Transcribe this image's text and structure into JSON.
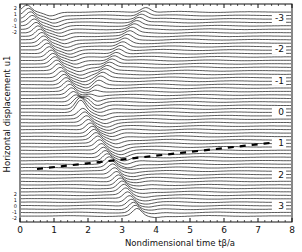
{
  "chart_data": {
    "type": "line",
    "subtype": "waterfall / stacked time traces",
    "title": "",
    "xlabel": "Nondimensional time tβ/a",
    "ylabel": "Horizontal displacement u1",
    "xlim": [
      0,
      8
    ],
    "x_ticks": [
      "0",
      "1",
      "2",
      "3",
      "4",
      "5",
      "6",
      "7",
      "8"
    ],
    "trace_scale_ticks_top": [
      "2",
      "1",
      "0",
      "-1",
      "-2"
    ],
    "trace_scale_ticks_bottom": [
      "2",
      "1",
      "0",
      "-1",
      "-2"
    ],
    "right_trace_labels": [
      "-3",
      "-2",
      "-1",
      "0",
      "1",
      "2",
      "3"
    ],
    "grid": false,
    "legend": null,
    "n_traces": 60,
    "features": [
      {
        "name": "dark diagonal wavefront",
        "from_x": 0.2,
        "to_x": 3.5,
        "direction": "down-right"
      },
      {
        "name": "second diagonal wavefront",
        "from_x": 0.8,
        "to_x": 4.0
      },
      {
        "name": "upper rising wavefront",
        "from_x": 1.6,
        "to_x": 3.8,
        "direction": "up-right"
      },
      {
        "name": "dashed dark band near trace 1",
        "from_x": 0.5,
        "to_x": 7.5
      }
    ]
  }
}
